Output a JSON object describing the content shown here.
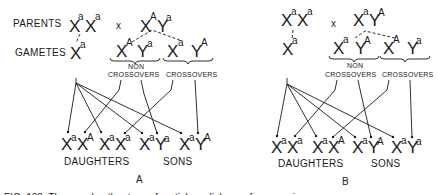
{
  "labels": {
    "parents": "PARENTS",
    "gametes": "GAMETES",
    "cross": "x",
    "non": "NON",
    "crossovers": "CROSSOVERS",
    "daughters": "DAUGHTERS",
    "sons": "SONS"
  },
  "panels": [
    {
      "id": "A",
      "label": "A",
      "mother": [
        {
          "c": "X",
          "s": "a"
        },
        {
          "c": "X",
          "s": "a"
        }
      ],
      "father": [
        {
          "c": "X",
          "s": "A"
        },
        {
          "c": "Y",
          "s": "a"
        }
      ],
      "mother_gamete": {
        "c": "X",
        "s": "a"
      },
      "noncrossover_gametes": [
        {
          "c": "X",
          "s": "A"
        },
        {
          "c": "Y",
          "s": "a"
        }
      ],
      "crossover_gametes": [
        {
          "c": "X",
          "s": "a"
        },
        {
          "c": "Y",
          "s": "A"
        }
      ],
      "offspring": [
        [
          {
            "c": "X",
            "s": "a"
          },
          {
            "c": "X",
            "s": "A"
          }
        ],
        [
          {
            "c": "X",
            "s": "a"
          },
          {
            "c": "X",
            "s": "a"
          }
        ],
        [
          {
            "c": "X",
            "s": "a"
          },
          {
            "c": "Y",
            "s": "a"
          }
        ],
        [
          {
            "c": "X",
            "s": "a"
          },
          {
            "c": "Y",
            "s": "A"
          }
        ]
      ]
    },
    {
      "id": "B",
      "label": "B",
      "mother": [
        {
          "c": "X",
          "s": "a"
        },
        {
          "c": "X",
          "s": "a"
        }
      ],
      "father": [
        {
          "c": "X",
          "s": "a"
        },
        {
          "c": "Y",
          "s": "A"
        }
      ],
      "mother_gamete": {
        "c": "X",
        "s": "a"
      },
      "noncrossover_gametes": [
        {
          "c": "X",
          "s": "a"
        },
        {
          "c": "Y",
          "s": "A"
        }
      ],
      "crossover_gametes": [
        {
          "c": "X",
          "s": "A"
        },
        {
          "c": "Y",
          "s": "a"
        }
      ],
      "offspring": [
        [
          {
            "c": "X",
            "s": "a"
          },
          {
            "c": "X",
            "s": "a"
          }
        ],
        [
          {
            "c": "X",
            "s": "a"
          },
          {
            "c": "X",
            "s": "A"
          }
        ],
        [
          {
            "c": "X",
            "s": "a"
          },
          {
            "c": "Y",
            "s": "A"
          }
        ],
        [
          {
            "c": "X",
            "s": "a"
          },
          {
            "c": "Y",
            "s": "a"
          }
        ]
      ]
    }
  ],
  "caption": "FIG. 108. The grandmother type of  partial sex-linkage of a recessive gene"
}
